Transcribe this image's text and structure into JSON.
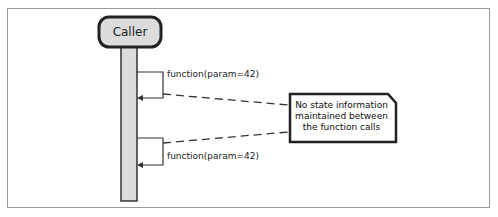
{
  "diagram": {
    "type": "sequence",
    "participant": {
      "label": "Caller"
    },
    "calls": [
      {
        "label": "function(param=42)"
      },
      {
        "label": "function(param=42)"
      }
    ],
    "note": {
      "lines": [
        "No state information",
        "maintained between",
        "the function calls"
      ]
    }
  }
}
